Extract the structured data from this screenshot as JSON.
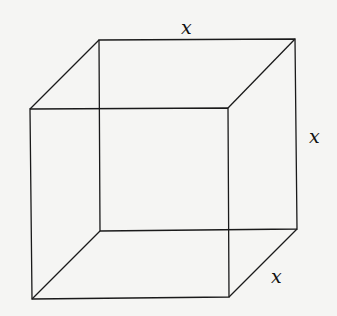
{
  "diagram": {
    "labels": {
      "top_edge": "x",
      "right_edge": "x",
      "depth_edge": "x"
    },
    "colors": {
      "line": "#1a1a1a",
      "background": "#f5f5f3"
    }
  }
}
